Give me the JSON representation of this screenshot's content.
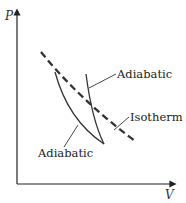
{
  "diagram": {
    "type": "pv-diagram",
    "axes": {
      "y_label": "P",
      "x_label": "V"
    },
    "curves": [
      {
        "id": "isotherm",
        "label": "Isotherm",
        "style": "dashed",
        "color": "#333333"
      },
      {
        "id": "adiabatic-steep",
        "label": "Adiabatic",
        "style": "solid",
        "color": "#333333"
      },
      {
        "id": "adiabatic-left",
        "label": "Adiabatic",
        "style": "solid",
        "color": "#333333"
      }
    ]
  }
}
